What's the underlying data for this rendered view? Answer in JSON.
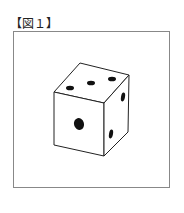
{
  "figure": {
    "label": "【図１】",
    "faces": {
      "top": {
        "pips": 3
      },
      "front": {
        "pips": 1
      },
      "right": {
        "pips": 2
      }
    }
  }
}
